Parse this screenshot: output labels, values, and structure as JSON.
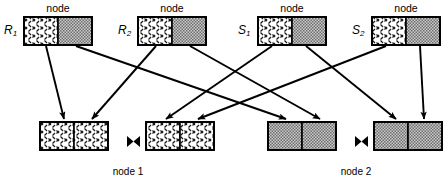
{
  "diagram": {
    "colors": {
      "line": "#000000",
      "hatch_fill": "#ffffff",
      "hatch_stroke": "#1a1a1a",
      "stipple_fill": "#c8c8c8",
      "stipple_dot": "#4d4d4d",
      "box_border": "#000000",
      "background": "#ffffff"
    },
    "top_nodes": [
      {
        "id": "n1",
        "label": "R",
        "subscript": "1",
        "caption": "node",
        "x": 24,
        "y": 17,
        "w": 68,
        "h": 28,
        "split": 34,
        "left_fill": "hatch",
        "right_fill": "stipple"
      },
      {
        "id": "n2",
        "label": "R",
        "subscript": "2",
        "caption": "node",
        "x": 138,
        "y": 17,
        "w": 68,
        "h": 28,
        "split": 34,
        "left_fill": "hatch",
        "right_fill": "stipple"
      },
      {
        "id": "n3",
        "label": "S",
        "subscript": "1",
        "caption": "node",
        "x": 258,
        "y": 17,
        "w": 68,
        "h": 28,
        "split": 34,
        "left_fill": "hatch",
        "right_fill": "stipple"
      },
      {
        "id": "n4",
        "label": "S",
        "subscript": "2",
        "caption": "node",
        "x": 372,
        "y": 17,
        "w": 68,
        "h": 28,
        "split": 34,
        "left_fill": "hatch",
        "right_fill": "stipple"
      }
    ],
    "bottom_boxes": [
      {
        "id": "b1",
        "x": 40,
        "y": 122,
        "w": 68,
        "h": 28,
        "split": 34,
        "left_fill": "hatch",
        "right_fill": "hatch"
      },
      {
        "id": "b2",
        "x": 146,
        "y": 122,
        "w": 68,
        "h": 28,
        "split": 34,
        "left_fill": "hatch",
        "right_fill": "hatch"
      },
      {
        "id": "b3",
        "x": 268,
        "y": 122,
        "w": 68,
        "h": 28,
        "split": 34,
        "left_fill": "stipple",
        "right_fill": "stipple"
      },
      {
        "id": "b4",
        "x": 374,
        "y": 122,
        "w": 68,
        "h": 28,
        "split": 34,
        "left_fill": "stipple",
        "right_fill": "stipple"
      }
    ],
    "join_symbols": [
      {
        "id": "j1",
        "glyph": "bowtie",
        "x": 127,
        "y": 136
      },
      {
        "id": "j2",
        "glyph": "bowtie",
        "x": 355,
        "y": 136
      }
    ],
    "node_captions": [
      {
        "id": "c1",
        "text": "node 1",
        "x": 128,
        "y": 167
      },
      {
        "id": "c2",
        "text": "node 2",
        "x": 356,
        "y": 167
      }
    ],
    "edges": [
      {
        "id": "e1",
        "from": "R1-left",
        "to": "b1-left",
        "x1": 46,
        "y1": 46,
        "x2": 64,
        "y2": 119
      },
      {
        "id": "e2",
        "from": "R1-right",
        "to": "b3-left",
        "x1": 76,
        "y1": 46,
        "x2": 286,
        "y2": 119
      },
      {
        "id": "e3",
        "from": "R2-left",
        "to": "b1-right",
        "x1": 156,
        "y1": 46,
        "x2": 92,
        "y2": 119
      },
      {
        "id": "e4",
        "from": "R2-right",
        "to": "b3-right",
        "x1": 190,
        "y1": 46,
        "x2": 320,
        "y2": 119
      },
      {
        "id": "e5",
        "from": "S1-left",
        "to": "b2-left",
        "x1": 272,
        "y1": 46,
        "x2": 166,
        "y2": 119
      },
      {
        "id": "e6",
        "from": "S1-right",
        "to": "b4-left",
        "x1": 306,
        "y1": 46,
        "x2": 396,
        "y2": 119
      },
      {
        "id": "e7",
        "from": "S2-left",
        "to": "b2-right",
        "x1": 386,
        "y1": 46,
        "x2": 198,
        "y2": 119
      },
      {
        "id": "e8",
        "from": "S2-right",
        "to": "b4-right",
        "x1": 420,
        "y1": 46,
        "x2": 424,
        "y2": 119
      }
    ]
  }
}
